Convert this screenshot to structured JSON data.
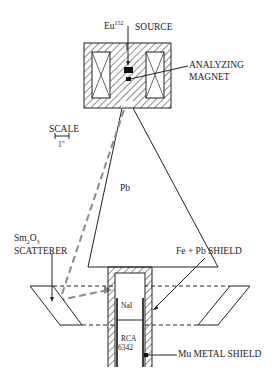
{
  "labels": {
    "source_isotope": "Eu",
    "source_mass": "152",
    "source": "SOURCE",
    "analyzing_1": "ANALYZING",
    "analyzing_2": "MAGNET",
    "scale": "SCALE",
    "scale_unit": "1\"",
    "pb": "Pb",
    "scatterer_formula_sm": "Sm",
    "scatterer_formula_sub1": "2",
    "scatterer_formula_o": "O",
    "scatterer_formula_sub2": "3",
    "scatterer": "SCATTERER",
    "fe_pb_shield": "Fe + Pb SHIELD",
    "nai": "NaI",
    "rca_1": "RCA",
    "rca_2": "6342",
    "mu_metal": "Mu METAL SHIELD"
  },
  "colors": {
    "line": "#222222",
    "beam": "#8a8a8a"
  }
}
